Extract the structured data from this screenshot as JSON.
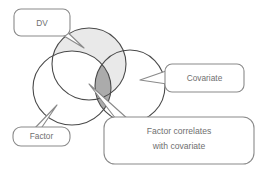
{
  "diagram": {
    "type": "venn-diagram",
    "title": "",
    "circles": [
      {
        "id": "dv",
        "label": "DV",
        "fill": "#e9e9e9",
        "stroke": "#4a4a4a",
        "cx": 89,
        "cy": 64,
        "rx": 37,
        "ry": 36
      },
      {
        "id": "factor",
        "label": "Factor",
        "fill": "#ffffff",
        "stroke": "#4a4a4a",
        "cx": 72,
        "cy": 88,
        "rx": 39,
        "ry": 37
      },
      {
        "id": "covariate",
        "label": "Covariate",
        "fill": "#ffffff",
        "stroke": "#4a4a4a",
        "cx": 130,
        "cy": 86,
        "rx": 35,
        "ry": 36
      }
    ],
    "overlap_region": {
      "id": "factor-covariate-overlap",
      "label": "Factor correlates with covariate",
      "fill": "#ababab",
      "stroke": "#4a4a4a"
    },
    "callouts": [
      {
        "id": "dv",
        "text": "DV",
        "lines": [
          "DV"
        ],
        "x": 14,
        "y": 9,
        "w": 56,
        "h": 27,
        "fill": "#ffffff",
        "stroke": "#8a8a8a",
        "text_color": "#6f6f6f"
      },
      {
        "id": "covariate",
        "text": "Covariate",
        "lines": [
          "Covariate"
        ],
        "x": 165,
        "y": 64,
        "w": 79,
        "h": 28,
        "fill": "#ffffff",
        "stroke": "#8a8a8a",
        "text_color": "#6f6f6f"
      },
      {
        "id": "factor",
        "text": "Factor",
        "lines": [
          "Factor"
        ],
        "x": 13,
        "y": 127,
        "w": 57,
        "h": 19,
        "fill": "#ffffff",
        "stroke": "#8a8a8a",
        "text_color": "#6f6f6f"
      },
      {
        "id": "factor-correlates",
        "text": "Factor correlates with covariate",
        "lines": [
          "Factor correlates",
          "with covariate"
        ],
        "x": 104,
        "y": 117,
        "w": 150,
        "h": 47,
        "fill": "#ffffff",
        "stroke": "#8a8a8a",
        "text_color": "#6f6f6f"
      }
    ],
    "colors": {
      "background": "#ffffff",
      "circle_outline": "#4a4a4a",
      "light_shade": "#e9e9e9",
      "dark_shade": "#ababab",
      "callout_outline": "#8a8a8a",
      "text": "#6f6f6f"
    }
  }
}
